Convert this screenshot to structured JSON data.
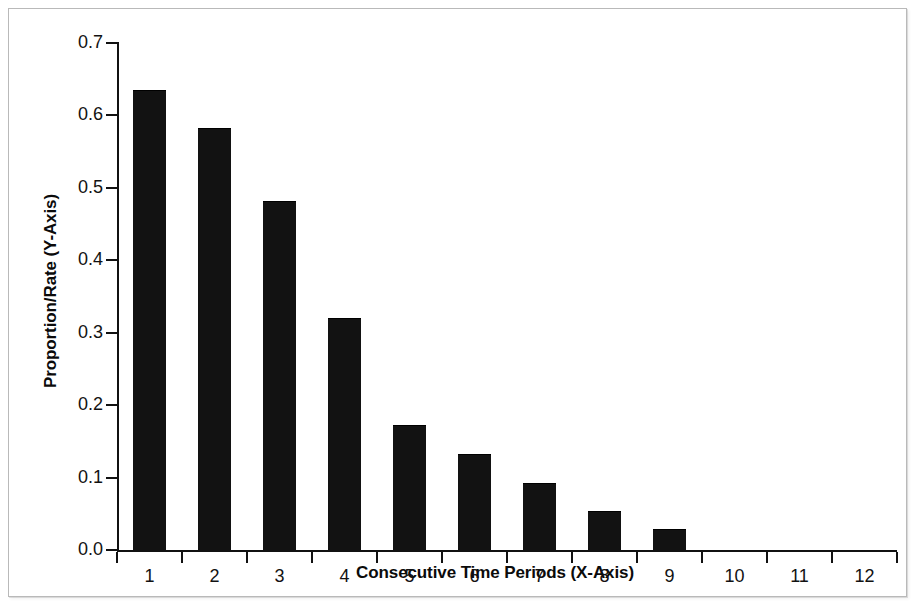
{
  "chart_data": {
    "type": "bar",
    "title": "",
    "subtitle": "",
    "xlabel": "Consecutive Time Periods (X-Axis)",
    "ylabel": "Proportion/Rate (Y-Axis)",
    "categories": [
      "1",
      "2",
      "3",
      "4",
      "5",
      "6",
      "7",
      "8",
      "9",
      "10",
      "11",
      "12"
    ],
    "values": [
      0.635,
      0.583,
      0.482,
      0.321,
      0.172,
      0.133,
      0.093,
      0.054,
      0.029,
      0.0,
      0.0,
      0.0
    ],
    "ylim": [
      0.0,
      0.7
    ],
    "ytick_step": 0.1,
    "ytick_labels": [
      "0.0",
      "0.1",
      "0.2",
      "0.3",
      "0.4",
      "0.5",
      "0.6",
      "0.7"
    ],
    "ytick_values": [
      0.0,
      0.1,
      0.2,
      0.3,
      0.4,
      0.5,
      0.6,
      0.7
    ],
    "xlim_categories": 12,
    "grid": false,
    "legend": null,
    "legend_position": "none",
    "bar_color": "#121212",
    "axis_color": "#111111",
    "background_color": "#ffffff",
    "annotations": []
  },
  "frame": {
    "border_color": "#b9b9b9"
  }
}
